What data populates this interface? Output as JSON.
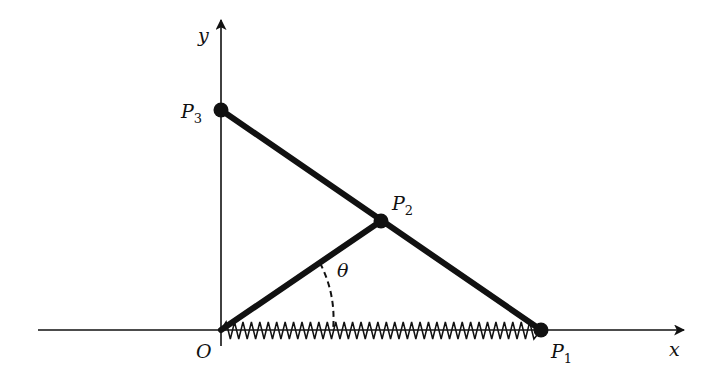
{
  "diagram": {
    "axes": {
      "x_label": "x",
      "y_label": "y",
      "origin_label": "O"
    },
    "points": [
      {
        "id": "P1",
        "base": "P",
        "sub": "1",
        "x": 541,
        "y": 330
      },
      {
        "id": "P2",
        "base": "P",
        "sub": "2",
        "x": 381,
        "y": 221
      },
      {
        "id": "P3",
        "base": "P",
        "sub": "3",
        "x": 221,
        "y": 110
      }
    ],
    "angle_label": "θ",
    "spring": {
      "from": "O",
      "to": "P1",
      "coils": 37
    },
    "colors": {
      "ink": "#111111",
      "background": "#ffffff"
    }
  }
}
